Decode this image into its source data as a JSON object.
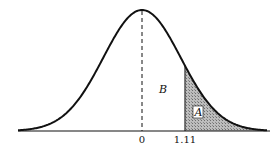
{
  "chart_data": {
    "type": "area",
    "title": "",
    "xlabel": "",
    "ylabel": "",
    "mean": 0,
    "cutoff": 1.11,
    "tick_labels": [
      "0",
      "1.11"
    ],
    "regions": [
      {
        "label": "B",
        "from": 0,
        "to": 1.11,
        "shaded": false
      },
      {
        "label": "A",
        "from": 1.11,
        "to": "inf",
        "shaded": true
      }
    ],
    "grid": false,
    "legend": false
  },
  "labels": {
    "tick_zero": "0",
    "tick_cutoff": "1.11",
    "region_b": "B",
    "region_a": "A"
  },
  "colors": {
    "curve": "#111111",
    "shade": "#9a9a9a"
  }
}
